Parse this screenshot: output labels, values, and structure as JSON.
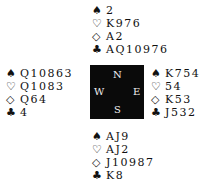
{
  "suits": {
    "spades": "♠",
    "hearts": "♡",
    "diamonds": "◇",
    "clubs": "♣"
  },
  "compass": {
    "north": "N",
    "south": "S",
    "west": "W",
    "east": "E"
  },
  "hands": {
    "north": {
      "spades": "2",
      "hearts": "K976",
      "diamonds": "A2",
      "clubs": "AQ10976"
    },
    "west": {
      "spades": "Q10863",
      "hearts": "Q1083",
      "diamonds": "Q64",
      "clubs": "4"
    },
    "east": {
      "spades": "K754",
      "hearts": "54",
      "diamonds": "K53",
      "clubs": "J532"
    },
    "south": {
      "spades": "AJ9",
      "hearts": "AJ2",
      "diamonds": "J10987",
      "clubs": "K8"
    }
  }
}
